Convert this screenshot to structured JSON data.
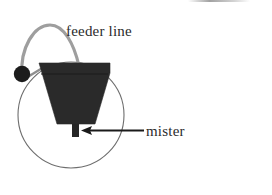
{
  "figure": {
    "background_color": "#ffffff",
    "width": 272,
    "height": 195,
    "labels": {
      "feeder_line": "feeder line",
      "mister": "mister"
    },
    "colors": {
      "pot_fill": "#2a2a2a",
      "canopy_outline": "#6e6e6e",
      "feeder_line": "#9a9a9a",
      "emitter_dot": "#1c1c1c",
      "mister_body": "#262626",
      "arrow": "#1a1a1a",
      "text": "#2b2b2b"
    },
    "elements": [
      {
        "name": "plant-canopy-circle",
        "shape": "circle",
        "center_x": 71,
        "center_y": 115,
        "radius": 53,
        "stroke_width": 1
      },
      {
        "name": "plant-pot",
        "shape": "trapezoid",
        "top_left_x": 39,
        "top_right_x": 110,
        "top_y": 63,
        "bottom_left_x": 57,
        "bottom_right_x": 95,
        "bottom_y": 124
      },
      {
        "name": "feeder-line",
        "shape": "arc-path",
        "start_x": 22,
        "start_y": 78,
        "end_x": 79,
        "end_y": 68,
        "stroke_width": 3
      },
      {
        "name": "emitter-dot",
        "shape": "circle",
        "center_x": 22,
        "center_y": 74,
        "radius": 8
      },
      {
        "name": "mister-device",
        "shape": "rect",
        "x": 72,
        "y": 124,
        "width": 7,
        "height": 13
      },
      {
        "name": "mister-leader-arrow",
        "shape": "arrow",
        "tail_x": 144,
        "tail_y": 131,
        "head_x": 82,
        "head_y": 131,
        "direction": "left"
      }
    ]
  }
}
